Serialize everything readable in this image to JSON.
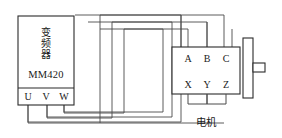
{
  "diagram": {
    "colors": {
      "background": "#ffffff",
      "body_stroke": "#2b2b2b",
      "wire_stroke": "#4a4a4a",
      "text": "#1a1a1a"
    }
  },
  "vfd": {
    "name_cjk_chars": [
      "变",
      "频",
      "器"
    ],
    "name_cjk": "变频器",
    "model": "MM420",
    "terminals": [
      {
        "label": "U"
      },
      {
        "label": "V"
      },
      {
        "label": "W"
      }
    ]
  },
  "motor": {
    "caption_cjk": "电机",
    "terminals_top": [
      {
        "label": "A"
      },
      {
        "label": "B"
      },
      {
        "label": "C"
      }
    ],
    "terminals_bottom": [
      {
        "label": "X"
      },
      {
        "label": "Y"
      },
      {
        "label": "Z"
      }
    ]
  },
  "wires": [
    {
      "from": "U",
      "to": "A"
    },
    {
      "from": "V",
      "to": "B"
    },
    {
      "from": "W",
      "to": "C"
    }
  ],
  "links": [
    {
      "from": "X",
      "to": "Y"
    },
    {
      "from": "Y",
      "to": "Z"
    }
  ]
}
